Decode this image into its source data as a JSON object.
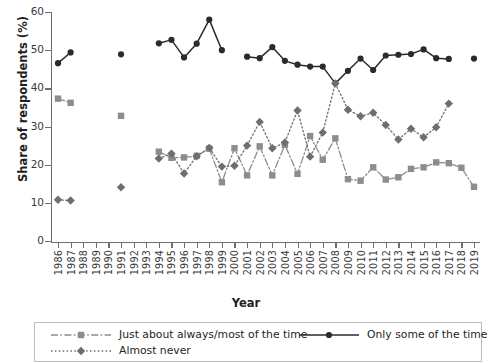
{
  "chart_data": {
    "type": "line",
    "title": "",
    "xlabel": "Year",
    "ylabel": "Share of respondents (%)",
    "xlim": [
      1986,
      2019
    ],
    "ylim": [
      0,
      60
    ],
    "yticks": [
      0,
      10,
      20,
      30,
      40,
      50,
      60
    ],
    "grid": false,
    "legend_position": "bottom",
    "x": [
      1986,
      1987,
      1988,
      1989,
      1990,
      1991,
      1992,
      1993,
      1994,
      1995,
      1996,
      1997,
      1998,
      1999,
      2000,
      2001,
      2002,
      2003,
      2004,
      2005,
      2006,
      2007,
      2008,
      2009,
      2010,
      2011,
      2012,
      2013,
      2014,
      2015,
      2016,
      2017,
      2018,
      2019
    ],
    "categories": [
      "1986",
      "1987",
      "1988",
      "1989",
      "1990",
      "1991",
      "1992",
      "1993",
      "1994",
      "1995",
      "1996",
      "1997",
      "1998",
      "1999",
      "2000",
      "2001",
      "2002",
      "2003",
      "2004",
      "2005",
      "2006",
      "2007",
      "2008",
      "2009",
      "2010",
      "2011",
      "2012",
      "2013",
      "2014",
      "2015",
      "2016",
      "2017",
      "2018",
      "2019"
    ],
    "series": [
      {
        "name": "Just about always/most of the time",
        "color": "#8d8d8d",
        "marker": "square",
        "linestyle": "dashdot",
        "values": [
          37.3,
          36.2,
          null,
          null,
          null,
          32.8,
          null,
          null,
          23.4,
          21.8,
          21.9,
          22.3,
          24.2,
          15.4,
          24.3,
          17.2,
          24.8,
          17.2,
          25.2,
          17.6,
          27.5,
          21.3,
          26.9,
          16.2,
          15.8,
          19.3,
          16.1,
          16.7,
          18.9,
          19.3,
          20.6,
          20.4,
          19.2,
          14.2
        ]
      },
      {
        "name": "Only some of the time",
        "color": "#2b2b2b",
        "marker": "circle",
        "linestyle": "solid",
        "values": [
          46.6,
          49.4,
          null,
          null,
          null,
          48.9,
          null,
          null,
          51.8,
          52.7,
          48.1,
          51.7,
          58.0,
          50.0,
          null,
          48.3,
          47.9,
          50.8,
          47.2,
          46.2,
          45.7,
          45.7,
          41.3,
          44.6,
          47.8,
          44.8,
          48.6,
          48.8,
          49.0,
          50.2,
          47.9,
          47.7,
          null,
          47.8
        ]
      },
      {
        "name": "Almost never",
        "color": "#6e6e6e",
        "marker": "diamond",
        "linestyle": "dotted",
        "values": [
          10.8,
          10.6,
          null,
          null,
          null,
          14.1,
          null,
          null,
          21.6,
          22.9,
          17.7,
          22.2,
          24.4,
          19.5,
          19.7,
          25.0,
          31.2,
          24.3,
          25.8,
          34.2,
          22.1,
          28.4,
          41.3,
          34.4,
          32.7,
          33.6,
          30.4,
          26.6,
          29.4,
          27.2,
          29.8,
          36.0,
          null,
          null
        ]
      }
    ]
  },
  "axes": {
    "y_title": "Share of respondents (%)",
    "x_title": "Year",
    "y_tick_labels": [
      "60",
      "50",
      "40",
      "30",
      "20",
      "10",
      "0"
    ]
  },
  "legend": {
    "items": [
      {
        "label": "Just about always/most of the time"
      },
      {
        "label": "Only some of the time"
      },
      {
        "label": "Almost never"
      }
    ]
  }
}
